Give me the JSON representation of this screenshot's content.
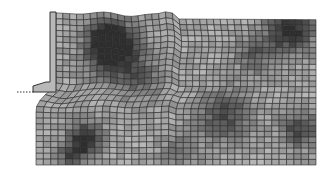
{
  "figure": {
    "mesh": {
      "columns": 38,
      "rows": 26,
      "line_color": "#2a2a2a",
      "shade_min": "#2e2e2e",
      "shade_max": "#d8d8d8",
      "dark_zones": [
        {
          "cx": 112,
          "cy": 50,
          "r": 28,
          "strength": 0.85
        },
        {
          "cx": 110,
          "cy": 40,
          "r": 16,
          "strength": 0.6
        },
        {
          "cx": 290,
          "cy": 30,
          "r": 22,
          "strength": 0.8
        },
        {
          "cx": 255,
          "cy": 55,
          "r": 20,
          "strength": 0.4
        },
        {
          "cx": 85,
          "cy": 140,
          "r": 18,
          "strength": 0.8
        },
        {
          "cx": 225,
          "cy": 115,
          "r": 26,
          "strength": 0.55
        },
        {
          "cx": 300,
          "cy": 130,
          "r": 18,
          "strength": 0.6
        },
        {
          "cx": 70,
          "cy": 158,
          "r": 12,
          "strength": 0.5
        },
        {
          "cx": 140,
          "cy": 80,
          "r": 22,
          "strength": 0.35
        },
        {
          "cx": 180,
          "cy": 150,
          "r": 20,
          "strength": 0.3
        }
      ]
    },
    "wall": {
      "fill": "#b8b8b8",
      "stroke": "#333333"
    },
    "base_line": {
      "style": "dotted",
      "color": "#333333"
    }
  }
}
